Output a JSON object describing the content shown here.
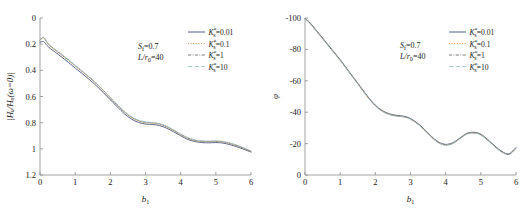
{
  "figure": {
    "background": "#ffffff",
    "panel_count": 2
  },
  "chart_data": [
    {
      "type": "line",
      "panel": "left",
      "title": "",
      "xlabel": "b₁",
      "ylabel": "|Hᵤ/Hᵤ(ω=0)|",
      "xlim": [
        0,
        6
      ],
      "ylim": [
        0,
        1.2
      ],
      "xticks": [
        "0",
        "1",
        "2",
        "3",
        "4",
        "5",
        "6"
      ],
      "yticks": [
        "0",
        "0.2",
        "0.4",
        "0.6",
        "0.8",
        "1",
        "1.2"
      ],
      "grid": false,
      "legend_position": "upper-right",
      "annotations": [
        "Sғ=0.7",
        "L/r₀=40"
      ],
      "series": [
        {
          "name": "K*ₛ=0.01",
          "style": "solid",
          "color": "#3c4a78",
          "x": [
            0,
            0.1,
            0.2,
            0.3,
            0.45,
            0.6,
            0.8,
            1.0,
            1.2,
            1.4,
            1.6,
            1.8,
            2.0,
            2.2,
            2.4,
            2.6,
            2.8,
            3.0,
            3.2,
            3.4,
            3.6,
            3.8,
            4.0,
            4.2,
            4.4,
            4.6,
            4.8,
            5.0,
            5.2,
            5.4,
            5.6,
            5.8,
            6.0
          ],
          "values": [
            1.015,
            1.02,
            0.99,
            0.965,
            0.935,
            0.905,
            0.862,
            0.818,
            0.775,
            0.73,
            0.683,
            0.63,
            0.575,
            0.52,
            0.468,
            0.428,
            0.402,
            0.39,
            0.386,
            0.378,
            0.358,
            0.33,
            0.3,
            0.272,
            0.256,
            0.248,
            0.246,
            0.248,
            0.244,
            0.232,
            0.216,
            0.196,
            0.175
          ]
        },
        {
          "name": "K*ₛ=0.1",
          "style": "dotted",
          "color": "#e08a3c",
          "x": [
            0,
            0.1,
            0.2,
            0.3,
            0.45,
            0.6,
            0.8,
            1.0,
            1.2,
            1.4,
            1.6,
            1.8,
            2.0,
            2.2,
            2.4,
            2.6,
            2.8,
            3.0,
            3.2,
            3.4,
            3.6,
            3.8,
            4.0,
            4.2,
            4.4,
            4.6,
            4.8,
            5.0,
            5.2,
            5.4,
            5.6,
            5.8,
            6.0
          ],
          "values": [
            1.03,
            1.048,
            1.01,
            0.982,
            0.95,
            0.92,
            0.878,
            0.834,
            0.79,
            0.745,
            0.697,
            0.644,
            0.588,
            0.532,
            0.48,
            0.44,
            0.414,
            0.401,
            0.396,
            0.388,
            0.368,
            0.34,
            0.309,
            0.281,
            0.264,
            0.256,
            0.254,
            0.256,
            0.252,
            0.24,
            0.223,
            0.202,
            0.18
          ]
        },
        {
          "name": "K*ₛ=1",
          "style": "dashdot",
          "color": "#6e6e6e",
          "x": [
            0,
            0.1,
            0.2,
            0.3,
            0.45,
            0.6,
            0.8,
            1.0,
            1.2,
            1.4,
            1.6,
            1.8,
            2.0,
            2.2,
            2.4,
            2.6,
            2.8,
            3.0,
            3.2,
            3.4,
            3.6,
            3.8,
            4.0,
            4.2,
            4.4,
            4.6,
            4.8,
            5.0,
            5.2,
            5.4,
            5.6,
            5.8,
            6.0
          ],
          "values": [
            1.032,
            1.052,
            1.014,
            0.986,
            0.954,
            0.924,
            0.881,
            0.837,
            0.793,
            0.748,
            0.7,
            0.647,
            0.591,
            0.535,
            0.483,
            0.443,
            0.417,
            0.404,
            0.399,
            0.391,
            0.371,
            0.343,
            0.312,
            0.284,
            0.267,
            0.259,
            0.257,
            0.259,
            0.255,
            0.243,
            0.226,
            0.205,
            0.182
          ]
        },
        {
          "name": "K*ₛ=10",
          "style": "dashed",
          "color": "#9ec6c4",
          "x": [
            0,
            0.1,
            0.2,
            0.3,
            0.45,
            0.6,
            0.8,
            1.0,
            1.2,
            1.4,
            1.6,
            1.8,
            2.0,
            2.2,
            2.4,
            2.6,
            2.8,
            3.0,
            3.2,
            3.4,
            3.6,
            3.8,
            4.0,
            4.2,
            4.4,
            4.6,
            4.8,
            5.0,
            5.2,
            5.4,
            5.6,
            5.8,
            6.0
          ],
          "values": [
            1.033,
            1.054,
            1.016,
            0.988,
            0.956,
            0.926,
            0.883,
            0.839,
            0.795,
            0.75,
            0.702,
            0.649,
            0.593,
            0.537,
            0.485,
            0.445,
            0.419,
            0.406,
            0.401,
            0.393,
            0.373,
            0.345,
            0.314,
            0.286,
            0.269,
            0.261,
            0.259,
            0.261,
            0.257,
            0.245,
            0.228,
            0.207,
            0.184
          ]
        }
      ]
    },
    {
      "type": "line",
      "panel": "right",
      "title": "",
      "xlabel": "b₁",
      "ylabel": "φ",
      "xlim": [
        0,
        6
      ],
      "ylim": [
        -100,
        0
      ],
      "xticks": [
        "0",
        "1",
        "2",
        "3",
        "4",
        "5",
        "6"
      ],
      "yticks": [
        "-100",
        "-80",
        "-60",
        "-40",
        "-20",
        "0"
      ],
      "grid": false,
      "legend_position": "upper-right",
      "annotations": [
        "Sғ=0.7",
        "L/r₀=40"
      ],
      "series": [
        {
          "name": "K*ₛ=0.01",
          "style": "solid",
          "color": "#3c4a78",
          "x": [
            0,
            0.1,
            0.2,
            0.4,
            0.6,
            0.8,
            1.0,
            1.2,
            1.4,
            1.6,
            1.8,
            2.0,
            2.2,
            2.4,
            2.6,
            2.8,
            3.0,
            3.2,
            3.4,
            3.6,
            3.8,
            4.0,
            4.2,
            4.4,
            4.6,
            4.8,
            5.0,
            5.2,
            5.4,
            5.6,
            5.8,
            6.0
          ],
          "values": [
            -0.5,
            -2.0,
            -4.5,
            -10.0,
            -15.5,
            -21.0,
            -26.5,
            -32.5,
            -38.5,
            -44.5,
            -50.5,
            -55.5,
            -59.0,
            -61.0,
            -62.0,
            -62.5,
            -64.0,
            -67.0,
            -71.0,
            -75.5,
            -79.0,
            -80.5,
            -79.5,
            -76.5,
            -73.5,
            -72.8,
            -74.0,
            -77.5,
            -81.5,
            -85.0,
            -86.5,
            -82.5
          ]
        },
        {
          "name": "K*ₛ=0.1",
          "style": "dotted",
          "color": "#e08a3c",
          "x": [
            0,
            0.1,
            0.2,
            0.4,
            0.6,
            0.8,
            1.0,
            1.2,
            1.4,
            1.6,
            1.8,
            2.0,
            2.2,
            2.4,
            2.6,
            2.8,
            3.0,
            3.2,
            3.4,
            3.6,
            3.8,
            4.0,
            4.2,
            4.4,
            4.6,
            4.8,
            5.0,
            5.2,
            5.4,
            5.6,
            5.8,
            6.0
          ],
          "values": [
            -0.5,
            -2.2,
            -4.8,
            -10.3,
            -15.8,
            -21.3,
            -26.8,
            -32.8,
            -38.8,
            -44.8,
            -50.8,
            -55.8,
            -59.3,
            -61.3,
            -62.3,
            -62.8,
            -64.3,
            -67.3,
            -71.3,
            -75.8,
            -79.3,
            -80.8,
            -79.8,
            -76.8,
            -73.8,
            -73.1,
            -74.3,
            -77.8,
            -81.8,
            -85.3,
            -86.8,
            -82.8
          ]
        },
        {
          "name": "K*ₛ=1",
          "style": "dashdot",
          "color": "#6e6e6e",
          "x": [
            0,
            0.1,
            0.2,
            0.4,
            0.6,
            0.8,
            1.0,
            1.2,
            1.4,
            1.6,
            1.8,
            2.0,
            2.2,
            2.4,
            2.6,
            2.8,
            3.0,
            3.2,
            3.4,
            3.6,
            3.8,
            4.0,
            4.2,
            4.4,
            4.6,
            4.8,
            5.0,
            5.2,
            5.4,
            5.6,
            5.8,
            6.0
          ],
          "values": [
            -0.6,
            -2.3,
            -4.9,
            -10.4,
            -15.9,
            -21.4,
            -26.9,
            -32.9,
            -38.9,
            -44.9,
            -50.9,
            -55.9,
            -59.4,
            -61.4,
            -62.4,
            -62.9,
            -64.4,
            -67.4,
            -71.4,
            -75.9,
            -79.4,
            -80.9,
            -79.9,
            -76.9,
            -73.9,
            -73.2,
            -74.4,
            -77.9,
            -81.9,
            -85.4,
            -86.9,
            -82.9
          ]
        },
        {
          "name": "K*ₛ=10",
          "style": "dashed",
          "color": "#9ec6c4",
          "x": [
            0,
            0.1,
            0.2,
            0.4,
            0.6,
            0.8,
            1.0,
            1.2,
            1.4,
            1.6,
            1.8,
            2.0,
            2.2,
            2.4,
            2.6,
            2.8,
            3.0,
            3.2,
            3.4,
            3.6,
            3.8,
            4.0,
            4.2,
            4.4,
            4.6,
            4.8,
            5.0,
            5.2,
            5.4,
            5.6,
            5.8,
            6.0
          ],
          "values": [
            -0.6,
            -2.4,
            -5.0,
            -10.5,
            -16.0,
            -21.5,
            -27.0,
            -33.0,
            -39.0,
            -45.0,
            -51.0,
            -56.0,
            -59.5,
            -61.5,
            -62.5,
            -63.0,
            -64.5,
            -67.5,
            -71.5,
            -76.0,
            -79.5,
            -81.0,
            -80.0,
            -77.0,
            -74.0,
            -73.3,
            -74.5,
            -78.0,
            -82.0,
            -85.5,
            -87.0,
            -83.0
          ]
        }
      ]
    }
  ],
  "left_panel": {
    "ytick_labels": [
      "1.2",
      "1",
      "0.8",
      "0.6",
      "0.4",
      "0.2",
      "0"
    ],
    "xtick_labels": [
      "0",
      "1",
      "2",
      "3",
      "4",
      "5",
      "6"
    ],
    "xaxis_title_main": "b",
    "xaxis_title_sub": "1",
    "yaxis_title": "|Hᵤ/Hᵤ(ω=0)|",
    "annotation_1_main": "S",
    "annotation_1_sub": "f",
    "annotation_1_value": "=0.7",
    "annotation_2_main": "L/r",
    "annotation_2_sub": "0",
    "annotation_2_value": "=40",
    "legend": [
      {
        "symbol": "K",
        "sub": "s",
        "sup": "*",
        "value": "=0.01",
        "style": "solid",
        "color": "#3c4a78"
      },
      {
        "symbol": "K",
        "sub": "s",
        "sup": "*",
        "value": "=0.1",
        "style": "dotted",
        "color": "#e08a3c"
      },
      {
        "symbol": "K",
        "sub": "s",
        "sup": "*",
        "value": "=1",
        "style": "dashdot",
        "color": "#6e6e6e"
      },
      {
        "symbol": "K",
        "sub": "s",
        "sup": "*",
        "value": "=10",
        "style": "dashed",
        "color": "#9ec6c4"
      }
    ]
  },
  "right_panel": {
    "ytick_labels": [
      "0",
      "-20",
      "-40",
      "-60",
      "-80",
      "-100"
    ],
    "xtick_labels": [
      "0",
      "1",
      "2",
      "3",
      "4",
      "5",
      "6"
    ],
    "xaxis_title_main": "b",
    "xaxis_title_sub": "1",
    "yaxis_title": "φ",
    "annotation_1_main": "S",
    "annotation_1_sub": "f",
    "annotation_1_value": "=0.7",
    "annotation_2_main": "L/r",
    "annotation_2_sub": "0",
    "annotation_2_value": "=40",
    "legend": [
      {
        "symbol": "K",
        "sub": "s",
        "sup": "*",
        "value": "=0.01",
        "style": "solid",
        "color": "#3c4a78"
      },
      {
        "symbol": "K",
        "sub": "s",
        "sup": "*",
        "value": "=0.1",
        "style": "dotted",
        "color": "#e08a3c"
      },
      {
        "symbol": "K",
        "sub": "s",
        "sup": "*",
        "value": "=1",
        "style": "dashdot",
        "color": "#6e6e6e"
      },
      {
        "symbol": "K",
        "sub": "s",
        "sup": "*",
        "value": "=10",
        "style": "dashed",
        "color": "#9ec6c4"
      }
    ]
  }
}
